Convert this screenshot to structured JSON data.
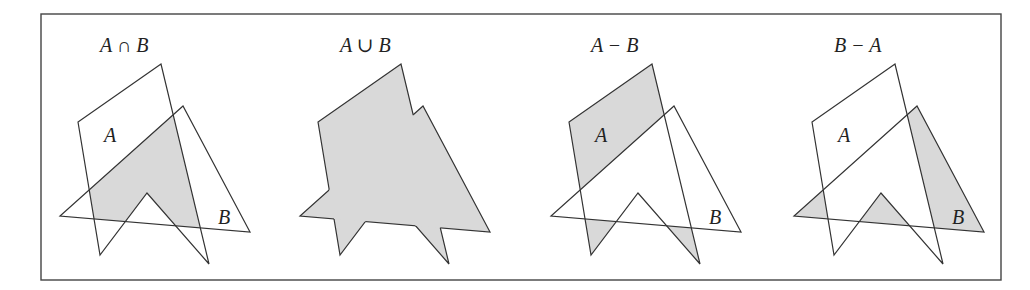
{
  "figure": {
    "frame": {
      "x": 41,
      "y": 14,
      "width": 960,
      "height": 266
    },
    "fill_color": "#d9d9d9",
    "stroke_color": "#333333",
    "panels": [
      {
        "id": "intersection",
        "title": "A ∩ B",
        "offset_x": 0,
        "label_a": "A",
        "label_b": "B",
        "shade": "intersection"
      },
      {
        "id": "union",
        "title": "A ∪ B",
        "offset_x": 240,
        "label_a": "",
        "label_b": "",
        "shade": "union"
      },
      {
        "id": "a-minus-b",
        "title": "A − B",
        "offset_x": 491,
        "label_a": "A",
        "label_b": "B",
        "shade": "a_minus_b"
      },
      {
        "id": "b-minus-a",
        "title": "B − A",
        "offset_x": 734,
        "label_a": "A",
        "label_b": "B",
        "shade": "b_minus_a"
      }
    ],
    "shapes": {
      "A": "78,122 100,255 147,193 209,264 161,64",
      "B": "183,106 60,216 250,232"
    }
  }
}
